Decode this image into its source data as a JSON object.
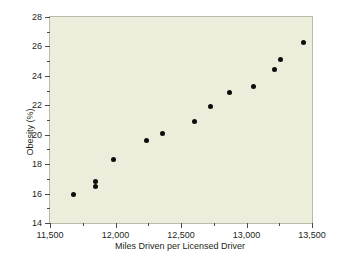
{
  "chart_data": {
    "type": "scatter",
    "title": "",
    "xlabel": "Miles Driven per Licensed Driver",
    "ylabel": "Obesity (%)",
    "xlim": [
      11500,
      13500
    ],
    "ylim": [
      14,
      28
    ],
    "grid": false,
    "legend": null,
    "x_major_ticks": [
      11500,
      12000,
      12500,
      13000,
      13500
    ],
    "x_major_tick_labels": [
      "11,500",
      "12,000",
      "12,500",
      "13,000",
      "13,500"
    ],
    "x_minor_ticks": [
      11750,
      12250,
      12750,
      13250
    ],
    "y_major_ticks": [
      14,
      16,
      18,
      20,
      22,
      24,
      26,
      28
    ],
    "y_major_tick_labels": [
      "14",
      "16",
      "18",
      "20",
      "22",
      "24",
      "26",
      "28"
    ],
    "y_minor_ticks": [
      15,
      17,
      19,
      21,
      23,
      25,
      27
    ],
    "marker": "filled-circle",
    "marker_color": "#0d0d0d",
    "plot_background": "#ecedda",
    "frame_color": "#b9b9ac",
    "points": [
      {
        "x": 11683,
        "y": 15.95
      },
      {
        "x": 11851,
        "y": 16.85
      },
      {
        "x": 11851,
        "y": 16.45
      },
      {
        "x": 11981,
        "y": 18.3
      },
      {
        "x": 12233,
        "y": 19.6
      },
      {
        "x": 12355,
        "y": 20.05
      },
      {
        "x": 12600,
        "y": 20.9
      },
      {
        "x": 12722,
        "y": 21.9
      },
      {
        "x": 12874,
        "y": 22.9
      },
      {
        "x": 13050,
        "y": 23.25
      },
      {
        "x": 13210,
        "y": 24.4
      },
      {
        "x": 13263,
        "y": 25.1
      },
      {
        "x": 13432,
        "y": 26.3
      }
    ],
    "x_values": [
      11683,
      11851,
      11851,
      11981,
      12233,
      12355,
      12600,
      12722,
      12874,
      13050,
      13210,
      13263,
      13432
    ],
    "y_values": [
      15.95,
      16.85,
      16.45,
      18.3,
      19.6,
      20.05,
      20.9,
      21.9,
      22.9,
      23.25,
      24.4,
      25.1,
      26.3
    ]
  }
}
